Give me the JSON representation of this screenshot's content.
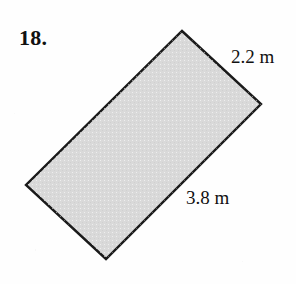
{
  "page": {
    "background_color": "#fefefe",
    "width": 296,
    "height": 284
  },
  "problem": {
    "number_label": "18."
  },
  "figure": {
    "shape": "rectangle",
    "orientation": "rotated",
    "fill_color": "#d9d9d9",
    "stroke_color": "#1a1a1a",
    "stroke_width": 2,
    "corners": {
      "top": [
        182,
        31
      ],
      "right": [
        261,
        104
      ],
      "bottom": [
        106,
        259
      ],
      "left": [
        26,
        185
      ]
    },
    "dimensions": {
      "short_side": "2.2 m",
      "long_side": "3.8 m"
    }
  }
}
